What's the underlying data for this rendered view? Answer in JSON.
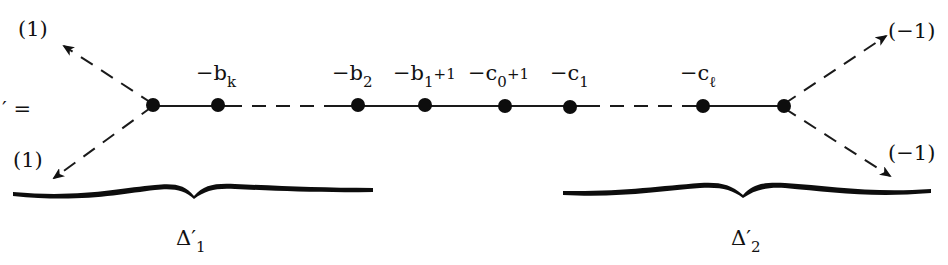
{
  "diagram": {
    "type": "weighted plumbing graph (chain with branching ends)",
    "left_fragment": "′ =",
    "colors": {
      "ink": "#111111",
      "background": "#ffffff"
    },
    "left_arrows": [
      {
        "label": "(1)",
        "direction": "up-left"
      },
      {
        "label": "(1)",
        "direction": "down-left"
      }
    ],
    "right_arrows": [
      {
        "label": "(−1)",
        "direction": "up-right"
      },
      {
        "label": "(−1)",
        "direction": "down-right"
      }
    ],
    "nodes": [
      {
        "id": "left-branch",
        "label": ""
      },
      {
        "id": "bk",
        "label_main": "−b",
        "label_sub": "k",
        "label_tail": ""
      },
      {
        "id": "b2",
        "label_main": "−b",
        "label_sub": "2",
        "label_tail": ""
      },
      {
        "id": "b1",
        "label_main": "−b",
        "label_sub": "1",
        "label_tail": "+1"
      },
      {
        "id": "c0",
        "label_main": "−c",
        "label_sub": "0",
        "label_tail": "+1"
      },
      {
        "id": "c1",
        "label_main": "−c",
        "label_sub": "1",
        "label_tail": ""
      },
      {
        "id": "cl",
        "label_main": "−c",
        "label_sub": "ℓ",
        "label_tail": ""
      },
      {
        "id": "right-branch",
        "label": ""
      }
    ],
    "edges": [
      {
        "from": "left-branch",
        "to": "bk",
        "style": "solid"
      },
      {
        "from": "bk",
        "to": "b2",
        "style": "dashed"
      },
      {
        "from": "b2",
        "to": "b1",
        "style": "solid"
      },
      {
        "from": "b1",
        "to": "c0",
        "style": "solid"
      },
      {
        "from": "c0",
        "to": "c1",
        "style": "solid"
      },
      {
        "from": "c1",
        "to": "cl",
        "style": "dashed"
      },
      {
        "from": "cl",
        "to": "right-branch",
        "style": "solid"
      }
    ],
    "braces": [
      {
        "label_main": "Δ′",
        "label_sub": "1"
      },
      {
        "label_main": "Δ′",
        "label_sub": "2"
      }
    ]
  }
}
